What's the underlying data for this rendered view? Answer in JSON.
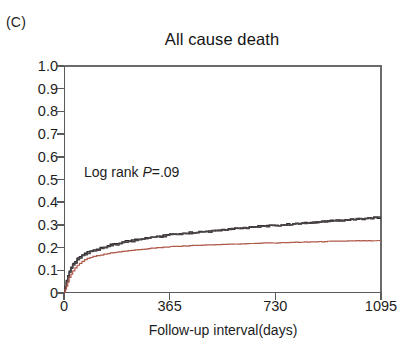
{
  "panel": {
    "label": "(C)"
  },
  "chart_data": {
    "type": "line",
    "title": "All cause death",
    "xlabel": "Follow-up interval(days)",
    "ylabel": "Incidence",
    "xlim": [
      0,
      1095
    ],
    "ylim": [
      0,
      1.0
    ],
    "xticks": [
      0,
      365,
      730,
      1095
    ],
    "xtick_labels": [
      "0",
      "365",
      "730",
      "1095"
    ],
    "yticks": [
      0,
      0.1,
      0.2,
      0.3,
      0.4,
      0.5,
      0.6,
      0.7,
      0.8,
      0.9,
      1.0
    ],
    "ytick_labels": [
      "0",
      "0.1",
      "0.2",
      "0.3",
      "0.4",
      "0.5",
      "0.6",
      "0.7",
      "0.8",
      "0.9",
      "1.0"
    ],
    "grid": false,
    "legend": null,
    "annotations": [
      {
        "name": "log-rank",
        "text": "Log rank P=.09",
        "static_text": "Log rank ",
        "italic_text": "P",
        "rest_text": "=.09",
        "x": 110,
        "y": 0.46
      }
    ],
    "colors": {
      "dark": "#2e2b2c",
      "dark_alt": "#4a4446",
      "red": "#b05a4a"
    },
    "series": [
      {
        "name": "group-1-dark",
        "color": "#2e2b2c",
        "x": [
          0,
          8,
          18,
          30,
          45,
          62,
          80,
          100,
          125,
          150,
          180,
          210,
          245,
          280,
          320,
          365,
          410,
          455,
          500,
          545,
          590,
          640,
          690,
          730,
          780,
          830,
          880,
          930,
          980,
          1030,
          1070,
          1095
        ],
        "y": [
          0.0,
          0.055,
          0.098,
          0.128,
          0.152,
          0.168,
          0.18,
          0.19,
          0.2,
          0.209,
          0.218,
          0.227,
          0.234,
          0.242,
          0.25,
          0.258,
          0.264,
          0.269,
          0.274,
          0.279,
          0.284,
          0.29,
          0.295,
          0.298,
          0.303,
          0.308,
          0.313,
          0.318,
          0.322,
          0.327,
          0.33,
          0.332
        ]
      },
      {
        "name": "group-2-dark",
        "color": "#4a4446",
        "x": [
          0,
          8,
          18,
          30,
          45,
          62,
          80,
          100,
          125,
          150,
          180,
          210,
          245,
          280,
          320,
          365,
          410,
          455,
          500,
          545,
          590,
          640,
          690,
          730,
          780,
          830,
          880,
          930,
          980,
          1030,
          1070,
          1095
        ],
        "y": [
          0.0,
          0.048,
          0.09,
          0.122,
          0.146,
          0.163,
          0.176,
          0.187,
          0.197,
          0.206,
          0.214,
          0.222,
          0.23,
          0.238,
          0.247,
          0.255,
          0.261,
          0.266,
          0.271,
          0.277,
          0.283,
          0.289,
          0.294,
          0.297,
          0.302,
          0.307,
          0.313,
          0.318,
          0.323,
          0.328,
          0.334,
          0.336
        ]
      },
      {
        "name": "group-3-red",
        "color": "#b05a4a",
        "x": [
          0,
          8,
          18,
          30,
          45,
          62,
          80,
          100,
          125,
          150,
          180,
          210,
          245,
          280,
          320,
          365,
          410,
          455,
          500,
          545,
          590,
          640,
          690,
          730,
          780,
          830,
          880,
          930,
          980,
          1030,
          1070,
          1095
        ],
        "y": [
          0.0,
          0.03,
          0.068,
          0.098,
          0.122,
          0.14,
          0.152,
          0.161,
          0.168,
          0.174,
          0.18,
          0.185,
          0.19,
          0.194,
          0.199,
          0.204,
          0.207,
          0.21,
          0.212,
          0.214,
          0.216,
          0.218,
          0.22,
          0.221,
          0.223,
          0.224,
          0.226,
          0.228,
          0.229,
          0.23,
          0.23,
          0.231
        ]
      }
    ]
  }
}
